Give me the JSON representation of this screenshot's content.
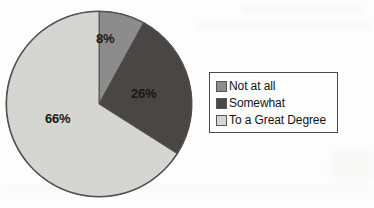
{
  "chart_data": {
    "type": "pie",
    "title": "",
    "categories": [
      "Not at all",
      "Somewhat",
      "To a Great Degree"
    ],
    "values": [
      8,
      26,
      66
    ],
    "value_labels": [
      "8%",
      "26%",
      "66%"
    ],
    "units": "percent",
    "total": 100,
    "start_angle_deg": 0,
    "direction": "clockwise",
    "colors": [
      "#8c8c8c",
      "#4a4644",
      "#d5d5d2"
    ],
    "legend": {
      "position": "right",
      "border_color": "#4a4a4a",
      "entries": [
        {
          "label": "Not at all",
          "color": "#8c8c8c",
          "value": 8
        },
        {
          "label": "Somewhat",
          "color": "#4a4644",
          "value": 26
        },
        {
          "label": "To a Great Degree",
          "color": "#d5d5d2",
          "value": 66
        }
      ]
    },
    "grid": false,
    "xlabel": "",
    "ylabel": ""
  },
  "figure": {
    "background_color": "#fdfdfd",
    "outline_color": "#4f4f4f"
  }
}
